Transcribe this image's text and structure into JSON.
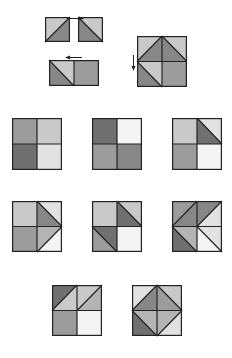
{
  "colors": {
    "white": "#f4f4f4",
    "very_light": "#e2e2e2",
    "light": "#c9c9c9",
    "light_medium": "#b4b4b4",
    "medium": "#9c9c9c",
    "medium_dark": "#878787",
    "dark": "#707070",
    "stroke": "#222222"
  },
  "tiles": [
    {
      "id": "piece-a",
      "x": 45,
      "y": 17,
      "w": 25,
      "h": 25,
      "polys": [
        {
          "pts": "0,0 1,0 0,1",
          "fill": "light"
        },
        {
          "pts": "1,0 1,1 0,1",
          "fill": "medium_dark"
        }
      ],
      "lines": [
        [
          0,
          1,
          1,
          0
        ]
      ]
    },
    {
      "id": "piece-b",
      "x": 78,
      "y": 17,
      "w": 25,
      "h": 25,
      "polys": [
        {
          "pts": "0,0 1,0 1,1",
          "fill": "light"
        },
        {
          "pts": "0,0 1,1 0,1",
          "fill": "medium_dark"
        }
      ],
      "lines": [
        [
          0,
          0,
          1,
          1
        ]
      ]
    },
    {
      "id": "piece-ab-joined",
      "x": 49,
      "y": 60,
      "w": 50,
      "h": 26,
      "polys": [
        {
          "pts": "0,0 0.5,0 0.5,1",
          "fill": "light"
        },
        {
          "pts": "0,0 0.5,1 0,1",
          "fill": "medium_dark"
        },
        {
          "pts": "0.5,0 1,0 1,1 0.5,1",
          "fill": "medium"
        }
      ],
      "lines": [
        [
          0,
          0,
          0.5,
          1
        ],
        [
          0.5,
          0,
          0.5,
          1
        ]
      ]
    },
    {
      "id": "piece-big",
      "x": 137,
      "y": 36,
      "w": 50,
      "h": 51,
      "polys": [
        {
          "pts": "0,0 0.5,0 0,0.5",
          "fill": "light"
        },
        {
          "pts": "0.5,0 0.5,0.5 0,0.5",
          "fill": "medium_dark"
        },
        {
          "pts": "0.5,0 1,0.5 0.5,0.5",
          "fill": "medium_dark"
        },
        {
          "pts": "0.5,0 1,0 1,0.5",
          "fill": "light"
        },
        {
          "pts": "0,0.5 0.5,0.5 0.5,1",
          "fill": "light"
        },
        {
          "pts": "0,0.5 0.5,1 0,1",
          "fill": "medium_dark"
        },
        {
          "pts": "0.5,0.5 1,0.5 1,1 0.5,1",
          "fill": "medium"
        }
      ],
      "lines": [
        [
          0,
          0.5,
          0.5,
          0
        ],
        [
          0.5,
          0,
          1,
          0.5
        ],
        [
          0,
          0.5,
          0.5,
          1
        ],
        [
          0.5,
          0,
          0.5,
          1
        ],
        [
          0,
          0.5,
          1,
          0.5
        ]
      ]
    },
    {
      "id": "row2-square1",
      "x": 12,
      "y": 118,
      "w": 50,
      "h": 52,
      "polys": [
        {
          "pts": "0,0 0.5,0 0.5,0.5 0,0.5",
          "fill": "medium"
        },
        {
          "pts": "0.5,0 1,0 1,0.5 0.5,0.5",
          "fill": "light"
        },
        {
          "pts": "0,0.5 0.5,0.5 0.5,1 0,1",
          "fill": "dark"
        },
        {
          "pts": "0.5,0.5 1,0.5 1,1 0.5,1",
          "fill": "very_light"
        }
      ],
      "lines": [
        [
          0.5,
          0,
          0.5,
          1
        ],
        [
          0,
          0.5,
          1,
          0.5
        ]
      ]
    },
    {
      "id": "row2-square2",
      "x": 92,
      "y": 118,
      "w": 50,
      "h": 52,
      "polys": [
        {
          "pts": "0,0 0.5,0 0.5,0.5 0,0.5",
          "fill": "dark"
        },
        {
          "pts": "0.5,0 1,0 1,0.5 0.5,0.5",
          "fill": "white"
        },
        {
          "pts": "0,0.5 0.5,0.5 0.5,1 0,1",
          "fill": "medium"
        },
        {
          "pts": "0.5,0.5 1,0.5 1,1 0.5,1",
          "fill": "medium_dark"
        }
      ],
      "lines": [
        [
          0.5,
          0,
          0.5,
          1
        ],
        [
          0,
          0.5,
          1,
          0.5
        ]
      ]
    },
    {
      "id": "row2-square3",
      "x": 172,
      "y": 118,
      "w": 50,
      "h": 52,
      "polys": [
        {
          "pts": "0,0 0.5,0 0.5,0.5 0,0.5",
          "fill": "light"
        },
        {
          "pts": "0.5,0 1,0 1,0.5",
          "fill": "very_light"
        },
        {
          "pts": "0.5,0 1,0.5 0.5,0.5",
          "fill": "dark"
        },
        {
          "pts": "0,0.5 0.5,0.5 0.5,1 0,1",
          "fill": "medium"
        },
        {
          "pts": "0.5,0.5 1,0.5 1,1 0.5,1",
          "fill": "white"
        }
      ],
      "lines": [
        [
          0.5,
          0,
          0.5,
          1
        ],
        [
          0,
          0.5,
          1,
          0.5
        ],
        [
          0.5,
          0,
          1,
          0.5
        ]
      ]
    },
    {
      "id": "row3-square1",
      "x": 12,
      "y": 201,
      "w": 50,
      "h": 51,
      "polys": [
        {
          "pts": "0,0 0.5,0 0.5,0.5 0,0.5",
          "fill": "light"
        },
        {
          "pts": "0.5,0 1,0 1,0.5",
          "fill": "very_light"
        },
        {
          "pts": "0.5,0 1,0.5 0.5,0.5",
          "fill": "medium_dark"
        },
        {
          "pts": "0,0.5 0.5,0.5 0.5,1 0,1",
          "fill": "medium"
        },
        {
          "pts": "0.5,0.5 1,0.5 0.5,1",
          "fill": "light_medium"
        },
        {
          "pts": "1,0.5 1,1 0.5,1",
          "fill": "white"
        }
      ],
      "lines": [
        [
          0.5,
          0,
          0.5,
          1
        ],
        [
          0,
          0.5,
          1,
          0.5
        ],
        [
          0.5,
          0,
          1,
          0.5
        ],
        [
          1,
          0.5,
          0.5,
          1
        ]
      ]
    },
    {
      "id": "row3-square2",
      "x": 92,
      "y": 201,
      "w": 50,
      "h": 51,
      "polys": [
        {
          "pts": "0,0 0.5,0 0.5,0.5 0,0.5",
          "fill": "light"
        },
        {
          "pts": "0.5,0 1,0 1,0.5",
          "fill": "light"
        },
        {
          "pts": "0.5,0 1,0.5 0.5,0.5",
          "fill": "dark"
        },
        {
          "pts": "0,0.5 0.5,0.5 0.5,1",
          "fill": "dark"
        },
        {
          "pts": "0,0.5 0.5,1 0,1",
          "fill": "medium"
        },
        {
          "pts": "0.5,0.5 1,0.5 1,1 0.5,1",
          "fill": "white"
        }
      ],
      "lines": [
        [
          0.5,
          0,
          0.5,
          1
        ],
        [
          0,
          0.5,
          1,
          0.5
        ],
        [
          0.5,
          0,
          1,
          0.5
        ],
        [
          0,
          0.5,
          0.5,
          1
        ]
      ]
    },
    {
      "id": "row3-square3",
      "x": 172,
      "y": 201,
      "w": 50,
      "h": 51,
      "polys": [
        {
          "pts": "0,0 0.5,0 0,0.5",
          "fill": "medium"
        },
        {
          "pts": "0.5,0 0.5,0.5 0,0.5",
          "fill": "medium_dark"
        },
        {
          "pts": "0.5,0 1,0 0.5,0.5",
          "fill": "medium_dark"
        },
        {
          "pts": "1,0 1,0.5 0.5,0.5",
          "fill": "very_light"
        },
        {
          "pts": "0,0.5 0.5,0.5 0.5,1",
          "fill": "light_medium"
        },
        {
          "pts": "0,0.5 0.5,1 0,1",
          "fill": "dark"
        },
        {
          "pts": "0.5,0.5 1,0.5 1,1",
          "fill": "very_light"
        },
        {
          "pts": "0.5,0.5 1,1 0.5,1",
          "fill": "white"
        }
      ],
      "lines": [
        [
          0.5,
          0,
          0.5,
          1
        ],
        [
          0,
          0.5,
          1,
          0.5
        ],
        [
          0,
          0.5,
          0.5,
          0
        ],
        [
          0.5,
          0.5,
          1,
          0
        ],
        [
          0,
          0.5,
          0.5,
          1
        ],
        [
          0.5,
          0.5,
          1,
          1
        ]
      ]
    },
    {
      "id": "row4-square1",
      "x": 52,
      "y": 285,
      "w": 50,
      "h": 51,
      "polys": [
        {
          "pts": "0,0 0.5,0 0,0.5",
          "fill": "dark"
        },
        {
          "pts": "0.5,0 0.5,0.5 0,0.5",
          "fill": "light"
        },
        {
          "pts": "0.5,0 1,0 0.5,0.5",
          "fill": "light"
        },
        {
          "pts": "1,0 1,0.5 0.5,0.5",
          "fill": "light_medium"
        },
        {
          "pts": "0,0.5 0.5,0.5 0.5,1 0,1",
          "fill": "medium"
        },
        {
          "pts": "0.5,0.5 1,0.5 1,1 0.5,1",
          "fill": "white"
        }
      ],
      "lines": [
        [
          0.5,
          0,
          0.5,
          1
        ],
        [
          0,
          0.5,
          1,
          0.5
        ],
        [
          0,
          0.5,
          0.5,
          0
        ],
        [
          0.5,
          0.5,
          1,
          0
        ]
      ]
    },
    {
      "id": "row4-square2",
      "x": 132,
      "y": 285,
      "w": 50,
      "h": 51,
      "polys": [
        {
          "pts": "0,0 0.5,0 0,0.5",
          "fill": "very_light"
        },
        {
          "pts": "0.5,0 0.5,0.5 0,0.5",
          "fill": "medium_dark"
        },
        {
          "pts": "0.5,0 1,0.5 0.5,0.5",
          "fill": "medium"
        },
        {
          "pts": "0.5,0 1,0 1,0.5",
          "fill": "light"
        },
        {
          "pts": "0,0.5 0.5,0.5 0.5,1",
          "fill": "light_medium"
        },
        {
          "pts": "0,0.5 0.5,1 0,1",
          "fill": "dark"
        },
        {
          "pts": "0.5,0.5 1,0.5 0.5,1",
          "fill": "light_medium"
        },
        {
          "pts": "1,0.5 1,1 0.5,1",
          "fill": "very_light"
        }
      ],
      "lines": [
        [
          0.5,
          0,
          0.5,
          1
        ],
        [
          0,
          0.5,
          1,
          0.5
        ],
        [
          0,
          0.5,
          0.5,
          0
        ],
        [
          0.5,
          0,
          1,
          0.5
        ],
        [
          0,
          0.5,
          0.5,
          1
        ],
        [
          1,
          0.5,
          0.5,
          1
        ]
      ]
    }
  ],
  "arrows": [
    {
      "id": "arrow-right",
      "x": 67,
      "y": 16,
      "w": 17,
      "h": 5,
      "direction": "right"
    },
    {
      "id": "arrow-left",
      "x": 65,
      "y": 55,
      "w": 17,
      "h": 5,
      "direction": "left"
    },
    {
      "id": "arrow-down",
      "x": 131,
      "y": 55,
      "w": 5,
      "h": 16,
      "direction": "down"
    }
  ]
}
